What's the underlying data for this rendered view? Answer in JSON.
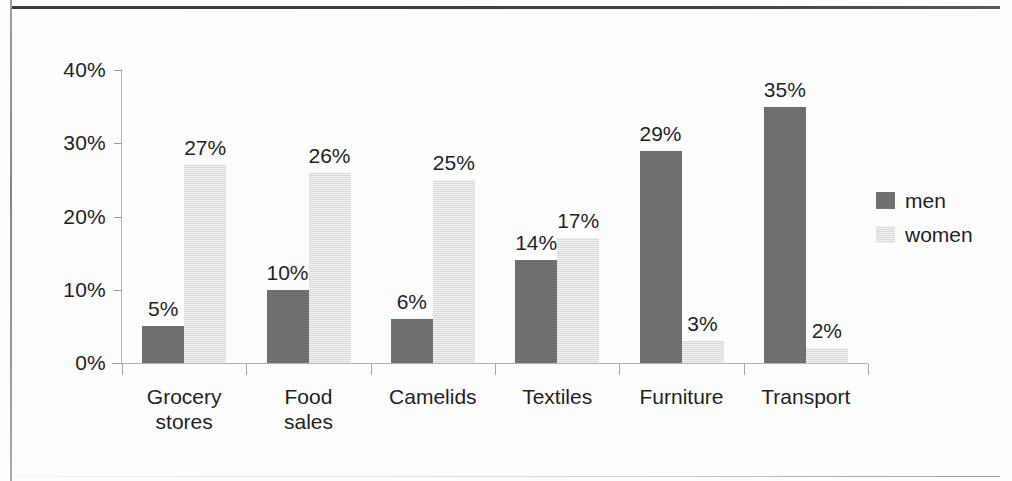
{
  "chart_data": {
    "type": "bar",
    "title": "",
    "subtitle": "",
    "xlabel": "",
    "ylabel": "",
    "categories": [
      "Grocery\nstores",
      "Food\nsales",
      "Camelids",
      "Textiles",
      "Furniture",
      "Transport"
    ],
    "series": [
      {
        "name": "men",
        "color": "#6e6e6e",
        "values": [
          5,
          10,
          6,
          14,
          29,
          35
        ],
        "labels": [
          "5%",
          "10%",
          "6%",
          "14%",
          "29%",
          "35%"
        ]
      },
      {
        "name": "women",
        "color": "#e2e2e2",
        "values": [
          27,
          26,
          25,
          17,
          3,
          2
        ],
        "labels": [
          "27%",
          "26%",
          "25%",
          "17%",
          "3%",
          "2%"
        ]
      }
    ],
    "ylim": [
      0,
      40
    ],
    "yticks": [
      0,
      10,
      20,
      30,
      40
    ],
    "ytick_labels": [
      "0%",
      "10%",
      "20%",
      "30%",
      "40%"
    ],
    "grid": false,
    "legend_position": "right",
    "value_labels_shown": true,
    "units": "percent"
  },
  "legend": {
    "entries": [
      {
        "label": "men"
      },
      {
        "label": "women"
      }
    ]
  },
  "colors": {
    "men": "#6e6e6e",
    "women": "#e2e2e2",
    "axis": "#b0b0b0",
    "text": "#1f1f1f",
    "page_rule": "#3a3a3a"
  }
}
